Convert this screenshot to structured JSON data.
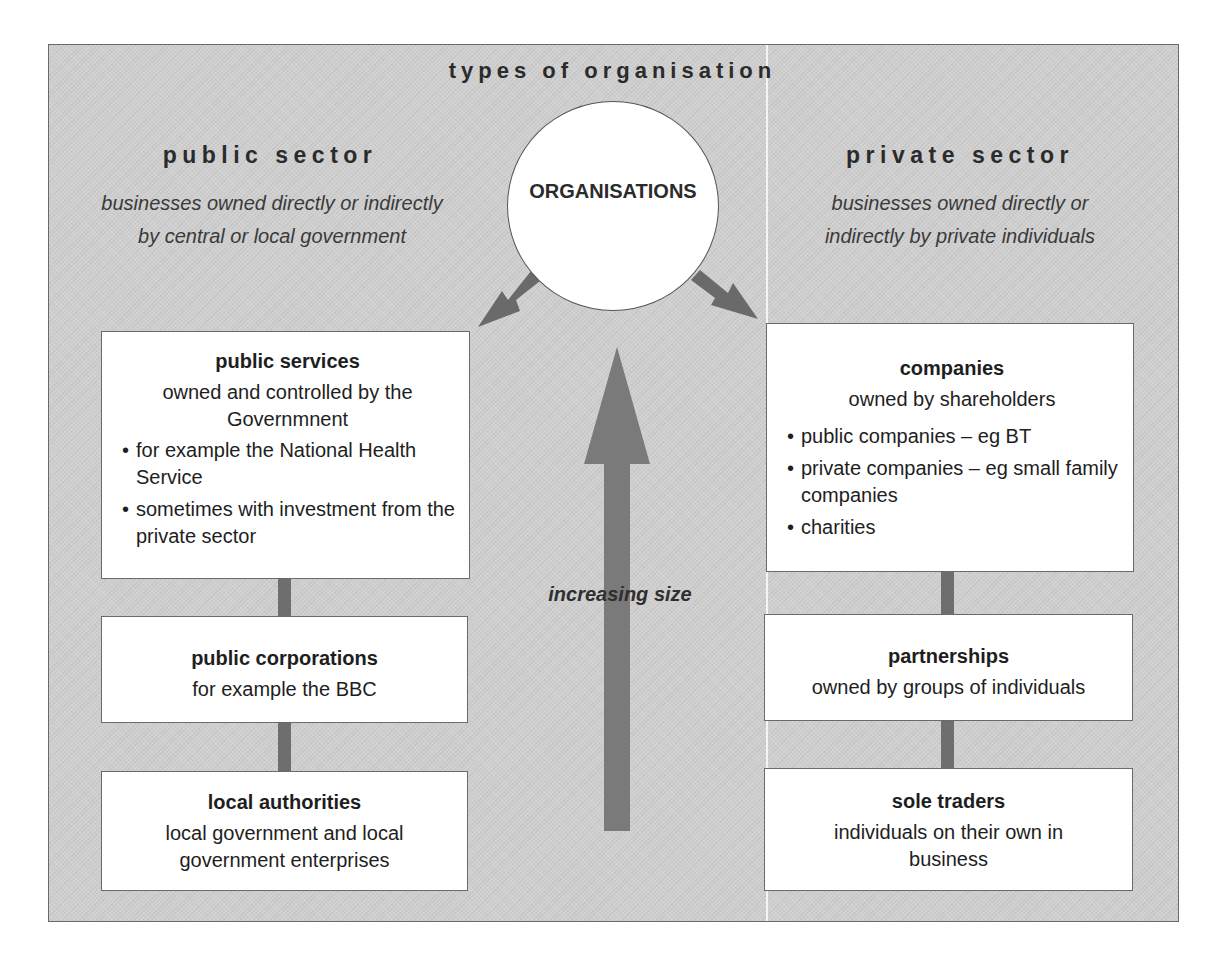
{
  "title": "types of organisation",
  "center": {
    "label": "ORGANISATIONS"
  },
  "public_sector": {
    "title": "public sector",
    "description_lines": [
      "businesses owned directly or indirectly",
      "by central or local government"
    ],
    "boxes": [
      {
        "heading": "public services",
        "subtitle_lines": [
          "owned and controlled by the",
          "Governmnent"
        ],
        "bullets": [
          "for example the National Health Service",
          "sometimes with investment from the private sector"
        ]
      },
      {
        "heading": "public corporations",
        "subtitle_lines": [
          "for example the BBC"
        ],
        "bullets": []
      },
      {
        "heading": "local authorities",
        "subtitle_lines": [
          "local government and local",
          "government enterprises"
        ],
        "bullets": []
      }
    ]
  },
  "private_sector": {
    "title": "private sector",
    "description_lines": [
      "businesses owned directly or",
      "indirectly by private individuals"
    ],
    "boxes": [
      {
        "heading": "companies",
        "subtitle_lines": [
          "owned by shareholders"
        ],
        "bullets": [
          "public companies – eg BT",
          "private companies – eg small family companies",
          "charities"
        ]
      },
      {
        "heading": "partnerships",
        "subtitle_lines": [
          "owned by groups of individuals"
        ],
        "bullets": []
      },
      {
        "heading": "sole traders",
        "subtitle_lines": [
          "individuals on their own in",
          "business"
        ],
        "bullets": []
      }
    ]
  },
  "size_arrow": {
    "label": "increasing size",
    "direction": "up"
  },
  "colors": {
    "background_panel": "#cfcfcf",
    "box_fill": "#ffffff",
    "arrow": "#6e6e6e",
    "text": "#2a2a2a"
  }
}
